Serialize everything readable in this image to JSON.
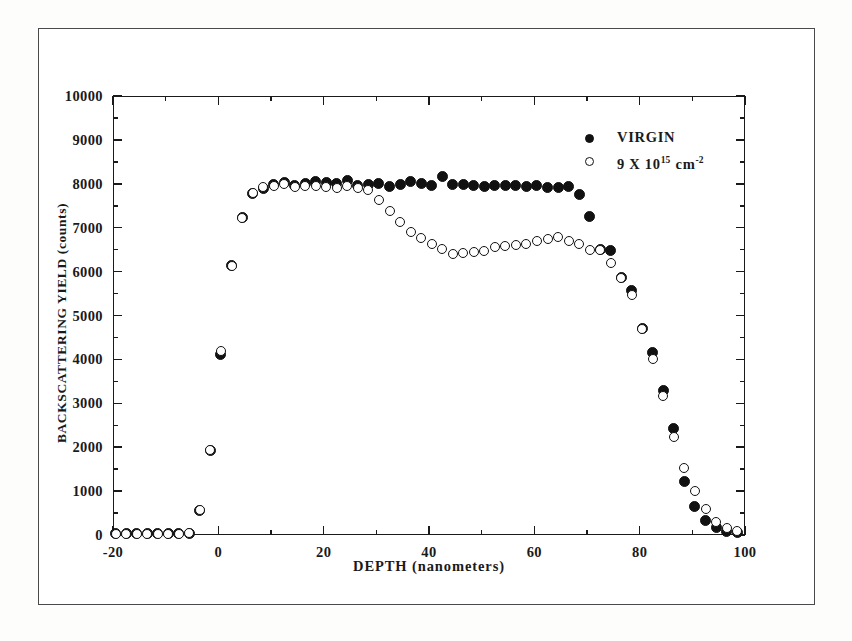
{
  "chart_data": {
    "type": "scatter",
    "title": "",
    "xlabel": "DEPTH (nanometers)",
    "ylabel": "BACKSCATTERING YIELD (counts)",
    "xlim": [
      -20,
      100
    ],
    "ylim": [
      0,
      10000
    ],
    "xticks": [
      -20,
      0,
      20,
      40,
      60,
      80,
      100
    ],
    "xtick_labels": [
      "-20",
      "0",
      "20",
      "40",
      "60",
      "80",
      "100"
    ],
    "x_minor_step": 10,
    "yticks": [
      0,
      1000,
      2000,
      3000,
      4000,
      5000,
      6000,
      7000,
      8000,
      9000,
      10000
    ],
    "ytick_labels": [
      "0",
      "1000",
      "2000",
      "3000",
      "4000",
      "5000",
      "6000",
      "7000",
      "8000",
      "9000",
      "10000"
    ],
    "y_minor_step": 500,
    "grid": false,
    "legend_position": "top-right",
    "marker_color": "#111111",
    "series": [
      {
        "name": "VIRGIN",
        "marker": "filled-circle",
        "x": [
          -19.5,
          -17.5,
          -15.5,
          -13.5,
          -11.5,
          -9.5,
          -7.5,
          -5.5,
          -3.5,
          -1.5,
          0.5,
          2.5,
          4.5,
          6.5,
          8.5,
          10.5,
          12.5,
          14.5,
          16.5,
          18.5,
          20.5,
          22.5,
          24.5,
          26.5,
          28.5,
          30.5,
          32.5,
          34.5,
          36.5,
          38.5,
          40.5,
          42.5,
          44.5,
          46.5,
          48.5,
          50.5,
          52.5,
          54.5,
          56.5,
          58.5,
          60.5,
          62.5,
          64.5,
          66.5,
          68.5,
          70.5,
          72.5,
          74.5,
          76.5,
          78.5,
          80.5,
          82.5,
          84.5,
          86.5,
          88.5,
          90.5,
          92.5,
          94.5,
          96.5,
          98.5
        ],
        "y": [
          30,
          30,
          30,
          30,
          30,
          30,
          30,
          40,
          560,
          1930,
          4120,
          6130,
          7230,
          7780,
          7900,
          7980,
          8030,
          7960,
          8000,
          8060,
          8020,
          8000,
          8080,
          7960,
          7980,
          8000,
          7940,
          7990,
          8050,
          8010,
          7960,
          8160,
          7980,
          7990,
          7960,
          7940,
          7970,
          7960,
          7950,
          7930,
          7950,
          7910,
          7920,
          7940,
          7750,
          7250,
          6500,
          6490,
          5860,
          5560,
          4700,
          4160,
          3300,
          2420,
          1230,
          640,
          330,
          170,
          80,
          60
        ]
      },
      {
        "name": "9 X 10^15 cm^-2",
        "marker": "open-circle",
        "x": [
          -19.5,
          -17.5,
          -15.5,
          -13.5,
          -11.5,
          -9.5,
          -7.5,
          -5.5,
          -3.5,
          -1.5,
          0.5,
          2.5,
          4.5,
          6.5,
          8.5,
          10.5,
          12.5,
          14.5,
          16.5,
          18.5,
          20.5,
          22.5,
          24.5,
          26.5,
          28.5,
          30.5,
          32.5,
          34.5,
          36.5,
          38.5,
          40.5,
          42.5,
          44.5,
          46.5,
          48.5,
          50.5,
          52.5,
          54.5,
          56.5,
          58.5,
          60.5,
          62.5,
          64.5,
          66.5,
          68.5,
          70.5,
          72.5,
          74.5,
          76.5,
          78.5,
          80.5,
          82.5,
          84.5,
          86.5,
          88.5,
          90.5,
          92.5,
          94.5,
          96.5,
          98.5
        ],
        "y": [
          30,
          30,
          30,
          30,
          30,
          30,
          30,
          40,
          560,
          1930,
          4180,
          6130,
          7230,
          7790,
          7920,
          7960,
          8000,
          7930,
          7950,
          7960,
          7920,
          7900,
          7960,
          7900,
          7850,
          7620,
          7380,
          7140,
          6900,
          6770,
          6640,
          6520,
          6400,
          6420,
          6440,
          6470,
          6560,
          6580,
          6600,
          6640,
          6700,
          6740,
          6780,
          6700,
          6620,
          6500,
          6490,
          6200,
          5850,
          5470,
          4700,
          4020,
          3160,
          2230,
          1530,
          1010,
          590,
          300,
          160,
          90
        ]
      }
    ]
  },
  "legend": {
    "items": [
      {
        "marker": "filled-circle",
        "label": "VIRGIN"
      },
      {
        "marker": "open-circle",
        "label_base": "9 X 10",
        "label_exp1": "15",
        "label_unit": "cm",
        "label_exp2": "-2"
      }
    ]
  }
}
